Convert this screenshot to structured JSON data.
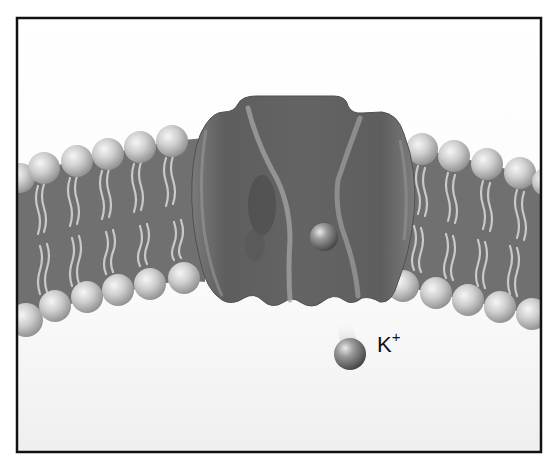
{
  "diagram": {
    "ion_label": {
      "element": "K",
      "charge": "+"
    },
    "components": [
      {
        "id": "frame",
        "label": "picture frame"
      },
      {
        "id": "lipid-bilayer",
        "label": "phospholipid bilayer"
      },
      {
        "id": "channel-protein",
        "label": "potassium channel protein"
      },
      {
        "id": "ion-in-channel",
        "label": "ion within channel pore"
      },
      {
        "id": "free-ion",
        "label": "K+ ion exiting channel"
      }
    ],
    "colors": {
      "background_top": "#ffffff",
      "background_bottom": "#f2f2f2",
      "frame": "#111111",
      "protein": "#6a6a6a",
      "protein_highlight": "#a9a9a9",
      "bilayer_core": "#6e6e6e",
      "lipid_tail": "#c8c8c8",
      "lipid_head": "#c4c4c4",
      "ion": "#6f6f6f"
    }
  }
}
